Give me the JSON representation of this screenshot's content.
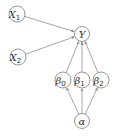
{
  "diagram": {
    "title": "",
    "nodes": [
      {
        "id": "X1",
        "label": "X",
        "subscript": "1"
      },
      {
        "id": "X2",
        "label": "X",
        "subscript": "2"
      },
      {
        "id": "Y",
        "label": "Y",
        "subscript": ""
      },
      {
        "id": "beta0",
        "label": "β",
        "subscript": "0"
      },
      {
        "id": "beta1",
        "label": "β",
        "subscript": "1"
      },
      {
        "id": "beta2",
        "label": "β",
        "subscript": "2"
      },
      {
        "id": "alpha",
        "label": "α",
        "subscript": ""
      }
    ],
    "edges": [
      {
        "from": "X1",
        "to": "Y"
      },
      {
        "from": "X2",
        "to": "Y"
      },
      {
        "from": "beta0",
        "to": "Y"
      },
      {
        "from": "beta1",
        "to": "Y"
      },
      {
        "from": "beta2",
        "to": "Y"
      },
      {
        "from": "alpha",
        "to": "beta0"
      },
      {
        "from": "alpha",
        "to": "beta1"
      },
      {
        "from": "alpha",
        "to": "beta2"
      }
    ],
    "colors": {
      "stroke": "#8a8a8a",
      "text": "#333333",
      "background": "#ffffff"
    }
  }
}
